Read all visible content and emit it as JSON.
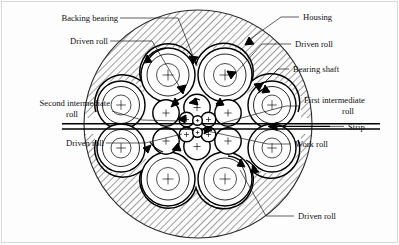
{
  "figure": {
    "background_color": "#fdfdfd",
    "line_color": "#000000",
    "hatch_color": "#555555"
  },
  "labels": {
    "backing_bearing": "Backing bearing",
    "driven_roll_top_left": "Driven roll",
    "second_intermediate_roll": "Second intermediate\nroll",
    "second_intermediate_roll_l1": "Second intermediate",
    "second_intermediate_roll_l2": "roll",
    "driven_roll_left": "Driven roll",
    "housing": "Housing",
    "driven_roll_top_right": "Driven roll",
    "bearing_shaft": "Bearing shaft",
    "first_intermediate_roll": "First intermediate\nroll",
    "first_intermediate_roll_l1": "First intermediate",
    "first_intermediate_roll_l2": "roll",
    "strip": "Strip",
    "work_roll": "Work roll",
    "driven_roll_bottom_right": "Driven roll"
  },
  "parts": {
    "housing_description": "Cross-hatched circular housing ring surrounding the roll cluster",
    "backing_bearings_count": 8,
    "second_intermediate_rolls_count": 6,
    "first_intermediate_rolls_count": 4,
    "work_rolls_count": 2,
    "strip_direction": "right-to-left",
    "roll_marker": "+"
  },
  "geometry": {
    "housing_center_x": 198,
    "housing_center_y": 124,
    "housing_outer_radius": 114,
    "housing_inner_radius": 92,
    "strip_y": 126,
    "strip_left_x": 62,
    "strip_right_x": 380,
    "backing_bearings": [
      {
        "cx": 168,
        "cy": 75,
        "r": 27
      },
      {
        "cx": 225,
        "cy": 75,
        "r": 27
      },
      {
        "cx": 121,
        "cy": 105,
        "r": 24
      },
      {
        "cx": 272,
        "cy": 105,
        "r": 24
      },
      {
        "cx": 121,
        "cy": 148,
        "r": 24
      },
      {
        "cx": 272,
        "cy": 148,
        "r": 24
      },
      {
        "cx": 168,
        "cy": 179,
        "r": 27
      },
      {
        "cx": 225,
        "cy": 179,
        "r": 27
      }
    ],
    "second_intermediate_rolls": [
      {
        "cx": 165,
        "cy": 113,
        "r": 13
      },
      {
        "cx": 196,
        "cy": 107,
        "r": 13
      },
      {
        "cx": 228,
        "cy": 113,
        "r": 13
      },
      {
        "cx": 165,
        "cy": 141,
        "r": 13
      },
      {
        "cx": 196,
        "cy": 147,
        "r": 13
      },
      {
        "cx": 228,
        "cy": 141,
        "r": 13
      }
    ],
    "first_intermediate_rolls": [
      {
        "cx": 185,
        "cy": 120,
        "r": 7.5
      },
      {
        "cx": 209,
        "cy": 120,
        "r": 7.5
      },
      {
        "cx": 185,
        "cy": 134,
        "r": 7.5
      },
      {
        "cx": 209,
        "cy": 134,
        "r": 7.5
      }
    ],
    "work_rolls": [
      {
        "cx": 197,
        "cy": 121,
        "r": 4.6
      },
      {
        "cx": 197,
        "cy": 132,
        "r": 4.6
      }
    ]
  },
  "leader_lines": {
    "backing_bearing_from": [
      120,
      18
    ],
    "backing_bearing_to": [
      183,
      60
    ],
    "driven_roll_top_left_from": [
      110,
      41
    ],
    "driven_roll_top_left_to": [
      163,
      94
    ],
    "second_intermediate_from": [
      110,
      110
    ],
    "second_intermediate_to": [
      176,
      119
    ],
    "driven_roll_left_from": [
      105,
      143
    ],
    "driven_roll_left_to": [
      170,
      140
    ],
    "housing_from": [
      300,
      16
    ],
    "housing_to": [
      248,
      41
    ],
    "driven_roll_top_right_from": [
      288,
      43
    ],
    "driven_roll_top_right_to": [
      236,
      78
    ],
    "bearing_shaft_from": [
      287,
      68
    ],
    "bearing_shaft_to": [
      258,
      87
    ],
    "first_intermediate_from": [
      300,
      105
    ],
    "first_intermediate_to": [
      216,
      122
    ],
    "strip_from": [
      350,
      126
    ],
    "strip_to": [
      268,
      126
    ],
    "work_roll_from": [
      296,
      143
    ],
    "work_roll_to": [
      206,
      130
    ],
    "driven_roll_bottom_right_from": [
      292,
      215
    ],
    "driven_roll_bottom_right_to": [
      240,
      170
    ]
  }
}
